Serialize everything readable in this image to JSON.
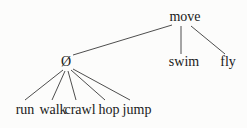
{
  "diagram": {
    "type": "tree",
    "root": {
      "id": "move",
      "label": "move",
      "x": 185,
      "y": 17
    },
    "nodes": [
      {
        "id": "null",
        "label": "Ø",
        "x": 66,
        "y": 62,
        "parent": "move"
      },
      {
        "id": "swim",
        "label": "swim",
        "x": 184,
        "y": 62,
        "parent": "move"
      },
      {
        "id": "fly",
        "label": "fly",
        "x": 228,
        "y": 62,
        "parent": "move"
      },
      {
        "id": "run",
        "label": "run",
        "x": 25,
        "y": 110,
        "parent": "null"
      },
      {
        "id": "walk",
        "label": "walk",
        "x": 53,
        "y": 110,
        "parent": "null"
      },
      {
        "id": "crawl",
        "label": "crawl",
        "x": 80,
        "y": 110,
        "parent": "null"
      },
      {
        "id": "hop",
        "label": "hop",
        "x": 109,
        "y": 110,
        "parent": "null"
      },
      {
        "id": "jump",
        "label": "jump",
        "x": 137,
        "y": 110,
        "parent": "null"
      }
    ],
    "edges": [
      {
        "from": "move",
        "to": "null",
        "x1": 172,
        "y1": 25,
        "x2": 73,
        "y2": 55
      },
      {
        "from": "move",
        "to": "swim",
        "x1": 181,
        "y1": 26,
        "x2": 181,
        "y2": 54
      },
      {
        "from": "move",
        "to": "fly",
        "x1": 191,
        "y1": 26,
        "x2": 225,
        "y2": 54
      },
      {
        "from": "null",
        "to": "run",
        "x1": 63,
        "y1": 70,
        "x2": 25,
        "y2": 100
      },
      {
        "from": "null",
        "to": "walk",
        "x1": 65,
        "y1": 71,
        "x2": 52,
        "y2": 100
      },
      {
        "from": "null",
        "to": "crawl",
        "x1": 68,
        "y1": 71,
        "x2": 76,
        "y2": 100
      },
      {
        "from": "null",
        "to": "hop",
        "x1": 71,
        "y1": 70,
        "x2": 105,
        "y2": 100
      },
      {
        "from": "null",
        "to": "jump",
        "x1": 73,
        "y1": 69,
        "x2": 130,
        "y2": 100
      }
    ]
  }
}
